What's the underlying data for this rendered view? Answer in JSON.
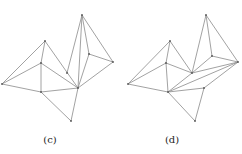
{
  "panels": [
    {
      "caption": "(c)",
      "caption_x": 50,
      "vertices": {
        "A": [
          2,
          84
        ],
        "B": [
          45,
          41
        ],
        "C": [
          41,
          63
        ],
        "D": [
          41,
          92
        ],
        "E": [
          82,
          15
        ],
        "F": [
          78,
          88
        ],
        "G": [
          89,
          54
        ],
        "H": [
          113,
          62
        ],
        "I": [
          71,
          121
        ],
        "J": [
          67,
          73
        ]
      },
      "edges": [
        [
          "A",
          "B"
        ],
        [
          "A",
          "C"
        ],
        [
          "A",
          "D"
        ],
        [
          "B",
          "C"
        ],
        [
          "C",
          "D"
        ],
        [
          "B",
          "F"
        ],
        [
          "C",
          "F"
        ],
        [
          "D",
          "F"
        ],
        [
          "D",
          "I"
        ],
        [
          "I",
          "F"
        ],
        [
          "F",
          "H"
        ],
        [
          "F",
          "E"
        ],
        [
          "E",
          "H"
        ],
        [
          "E",
          "G"
        ],
        [
          "G",
          "H"
        ],
        [
          "G",
          "F"
        ],
        [
          "E",
          "J"
        ]
      ]
    },
    {
      "caption": "(d)",
      "caption_x": 172,
      "vertices": {
        "A": [
          128,
          84
        ],
        "B": [
          170,
          41
        ],
        "C": [
          166,
          63
        ],
        "D": [
          168,
          92
        ],
        "E": [
          206,
          15
        ],
        "F": [
          192,
          73
        ],
        "G": [
          212,
          56
        ],
        "H": [
          238,
          62
        ],
        "I": [
          195,
          121
        ],
        "K": [
          204,
          88
        ]
      },
      "edges": [
        [
          "A",
          "B"
        ],
        [
          "A",
          "C"
        ],
        [
          "A",
          "D"
        ],
        [
          "B",
          "C"
        ],
        [
          "C",
          "D"
        ],
        [
          "B",
          "F"
        ],
        [
          "C",
          "F"
        ],
        [
          "D",
          "F"
        ],
        [
          "D",
          "I"
        ],
        [
          "I",
          "K"
        ],
        [
          "K",
          "H"
        ],
        [
          "D",
          "H"
        ],
        [
          "D",
          "K"
        ],
        [
          "F",
          "H"
        ],
        [
          "F",
          "E"
        ],
        [
          "E",
          "H"
        ],
        [
          "E",
          "G"
        ],
        [
          "G",
          "H"
        ],
        [
          "F",
          "G"
        ]
      ]
    }
  ],
  "stroke_color": "#8a8a8a"
}
